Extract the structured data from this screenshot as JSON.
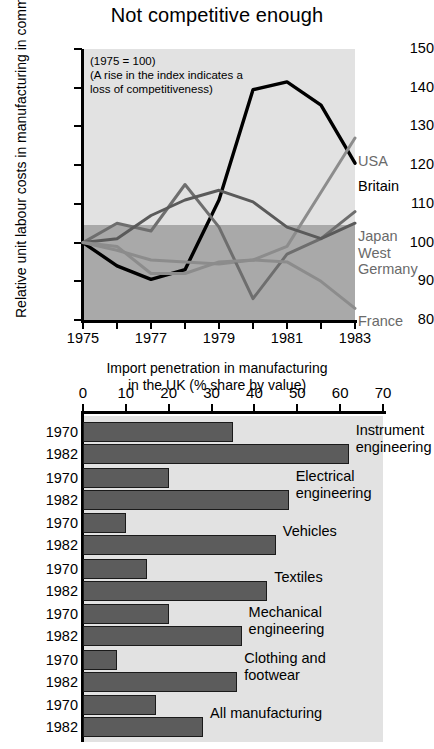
{
  "title": "Not competitive enough",
  "colors": {
    "britain": "#000000",
    "usa": "#8c8c8c",
    "japan": "#6e6e6e",
    "west_germany": "#5a5a5a",
    "france": "#8c8c8c",
    "bar_fill": "#5c5c5c",
    "panel_upper": "#e2e2e2",
    "panel_lower": "#a9a9a9"
  },
  "chart_data": [
    {
      "type": "line",
      "title": "Not competitive enough",
      "xlabel": "",
      "ylabel": "Relative unit labour costs in manufacturing in common currency",
      "annotation": "(1975 = 100)\n(A rise in the index indicates a\nloss of competitiveness)",
      "annotation_lines": [
        "(1975 = 100)",
        "(A rise in the index indicates a",
        "loss of competitiveness)"
      ],
      "x": [
        1975,
        1976,
        1977,
        1978,
        1979,
        1980,
        1981,
        1982,
        1983
      ],
      "xlim": [
        1974.5,
        1983.3
      ],
      "ylim": [
        80,
        150
      ],
      "yticks": [
        80,
        90,
        100,
        110,
        120,
        130,
        140,
        150
      ],
      "xticks": [
        1975,
        1976,
        1977,
        1978,
        1979,
        1980,
        1981,
        1982,
        1983
      ],
      "xticklabels_shown": [
        "1975",
        "1977",
        "1979",
        "1981",
        "1983"
      ],
      "grid": false,
      "legend_position": "right-inline-labels",
      "reference_band": {
        "from": 80,
        "to": 100,
        "note": "darker shading below index 100"
      },
      "series": [
        {
          "name": "Britain",
          "color": "#000000",
          "values": [
            100,
            94,
            90.5,
            93,
            111,
            139.5,
            141.5,
            135.5,
            120.5
          ]
        },
        {
          "name": "USA",
          "color": "#8c8c8c",
          "values": [
            100,
            98,
            95.5,
            95,
            94.5,
            95.5,
            99,
            113,
            127
          ]
        },
        {
          "name": "Japan",
          "color": "#6e6e6e",
          "values": [
            100,
            105,
            103,
            115,
            104,
            85.5,
            97,
            101,
            108
          ]
        },
        {
          "name": "West Germany",
          "color": "#5a5a5a",
          "values": [
            100,
            101,
            107,
            111,
            113.5,
            110.5,
            104,
            101,
            105
          ]
        },
        {
          "name": "France",
          "color": "#8c8c8c",
          "values": [
            100,
            99,
            92,
            92,
            95,
            95.5,
            95,
            90,
            83
          ]
        }
      ]
    },
    {
      "type": "bar",
      "orientation": "horizontal",
      "title": "Import penetration in manufacturing\nin the UK (% share by value)",
      "title_lines": [
        "Import penetration in manufacturing",
        "in the UK (% share by value)"
      ],
      "xlabel": "",
      "ylabel": "",
      "xlim": [
        0,
        70
      ],
      "xticks": [
        0,
        10,
        20,
        30,
        40,
        50,
        60,
        70
      ],
      "grid": false,
      "series_names": [
        "1970",
        "1982"
      ],
      "categories": [
        "Instrument engineering",
        "Electrical engineering",
        "Vehicles",
        "Textiles",
        "Mechanical engineering",
        "Clothing and footwear",
        "All manufacturing"
      ],
      "category_label_lines": [
        [
          "Instrument",
          "engineering"
        ],
        [
          "Electrical",
          "engineering"
        ],
        [
          "Vehicles"
        ],
        [
          "Textiles"
        ],
        [
          "Mechanical",
          "engineering"
        ],
        [
          "Clothing and",
          "footwear"
        ],
        [
          "All manufacturing"
        ]
      ],
      "series": [
        {
          "name": "1970",
          "values": [
            35,
            20,
            10,
            15,
            20,
            8,
            17
          ]
        },
        {
          "name": "1982",
          "values": [
            62,
            48,
            45,
            43,
            37,
            36,
            28
          ]
        }
      ]
    }
  ]
}
